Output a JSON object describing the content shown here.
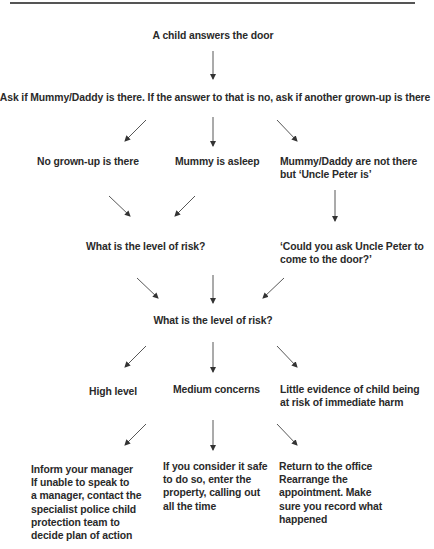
{
  "flowchart": {
    "start": "A child answers the door",
    "ask": "Ask if Mummy/Daddy is there. If the answer to that is no, ask if another grown-up is there",
    "branch1": {
      "no_grownup": "No grown-up is there",
      "mummy_asleep": "Mummy is asleep",
      "uncle_peter": [
        "Mummy/Daddy are not there",
        "but ‘Uncle Peter is’"
      ]
    },
    "level_of_risk_1": "What is the level of risk?",
    "ask_uncle": [
      "‘Could you ask Uncle Peter to",
      "come to the door?’"
    ],
    "level_of_risk_2": "What is the level of risk?",
    "risk_levels": {
      "high": "High level",
      "medium": "Medium concerns",
      "little": [
        "Little evidence of child being",
        "at risk of immediate harm"
      ]
    },
    "actions": {
      "high": [
        "Inform your manager",
        "If unable to speak to",
        "a manager, contact the",
        "specialist police child",
        "protection team to",
        "decide plan of action"
      ],
      "medium": [
        "If you consider it safe",
        "to do so, enter the",
        "property, calling out",
        "all the time"
      ],
      "little": [
        "Return to the office",
        "Rearrange the",
        "appointment. Make",
        "sure you record what",
        "happened"
      ]
    }
  },
  "colors": {
    "text": "#2a2a2a",
    "arrow": "#333333",
    "rule": "#555555"
  }
}
